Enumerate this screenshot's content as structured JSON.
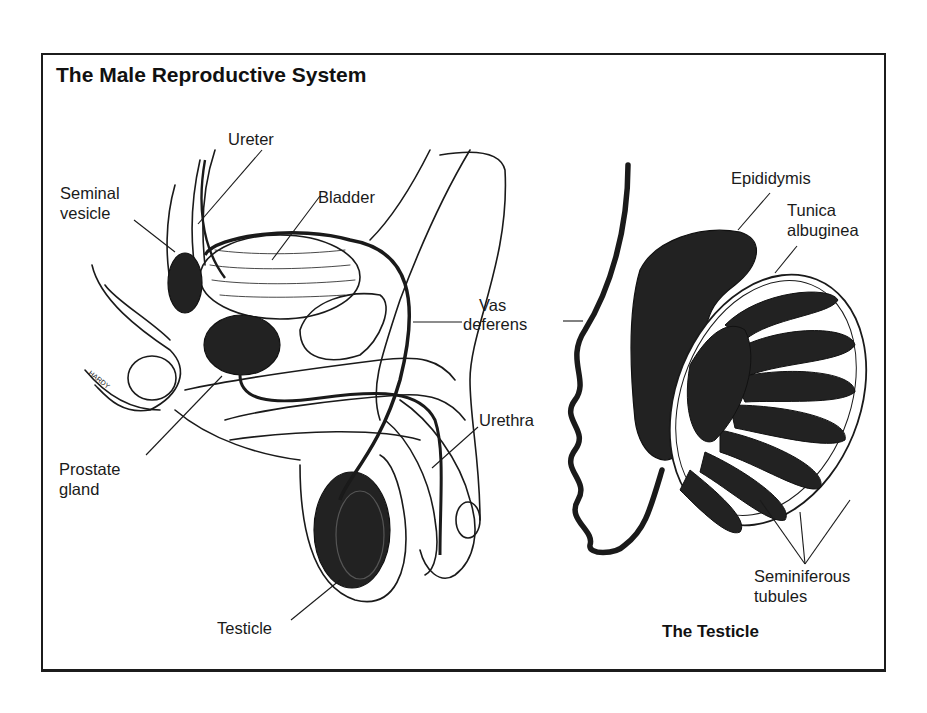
{
  "figure": {
    "title": "The Male Reproductive System",
    "panels": [
      {
        "id": "sagittal-section",
        "labels": {
          "ureter": "Ureter",
          "seminal_vesicle_line1": "Seminal",
          "seminal_vesicle_line2": "vesicle",
          "bladder": "Bladder",
          "vas_deferens_line1": "Vas",
          "vas_deferens_line2": "deferens",
          "urethra": "Urethra",
          "prostate_line1": "Prostate",
          "prostate_line2": "gland",
          "testicle": "Testicle"
        },
        "signature": "HARDY"
      },
      {
        "id": "testicle-detail",
        "caption": "The Testicle",
        "labels": {
          "epididymis": "Epididymis",
          "tunica_line1": "Tunica",
          "tunica_line2": "albuginea",
          "seminiferous_line1": "Seminiferous",
          "seminiferous_line2": "tubules"
        }
      }
    ],
    "colors": {
      "ink": "#1a1a1a",
      "paper": "#ffffff",
      "fill_dark": "#2a2a2a"
    }
  }
}
